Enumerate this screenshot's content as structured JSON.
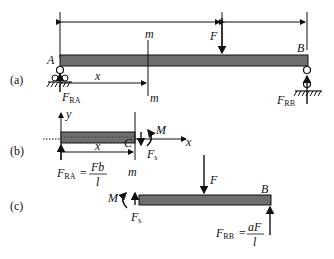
{
  "diagram": {
    "type": "simply-supported beam free-body diagrams",
    "colors": {
      "beam_fill": "#6e6e6e",
      "line": "#111111",
      "background": "#ffffff"
    },
    "panel_a": {
      "label": "(a)",
      "point_A": "A",
      "point_B": "B",
      "force": "F",
      "section_top": "m",
      "section_bottom": "m",
      "distance": "x",
      "reaction_A": {
        "main": "F",
        "sub": "RA"
      },
      "reaction_B": {
        "main": "F",
        "sub": "RB"
      }
    },
    "panel_b": {
      "label": "(b)",
      "axis_y": "y",
      "axis_x": "x",
      "point_C": "C",
      "moment": "M",
      "shear": {
        "main": "F",
        "sub": "s"
      },
      "distance": "x",
      "section": "m",
      "reaction_A": {
        "main": "F",
        "sub": "RA",
        "eq": "=",
        "num": "Fb",
        "den": "l"
      }
    },
    "panel_c": {
      "label": "(c)",
      "force": "F",
      "point_B": "B",
      "moment": "M",
      "shear": {
        "main": "F",
        "sub": "s"
      },
      "reaction_B": {
        "main": "F",
        "sub": "RB",
        "eq": "=",
        "num": "aF",
        "den": "l"
      }
    }
  }
}
